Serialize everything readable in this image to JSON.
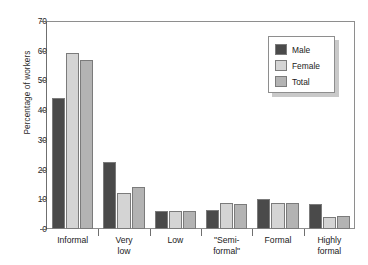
{
  "caption_sliver": "",
  "chart_data": {
    "type": "bar",
    "title": "",
    "xlabel": "",
    "ylabel": "Percentage of workers",
    "ylim": [
      0,
      70
    ],
    "ytick_step": 10,
    "yticks": [
      0,
      10,
      20,
      30,
      40,
      50,
      60,
      70
    ],
    "grid": false,
    "legend_position": "top-right",
    "categories": [
      "Informal",
      "Very low",
      "Low",
      "\"Semi-formal\"",
      "Formal",
      "Highly formal"
    ],
    "category_lines": [
      [
        "Informal"
      ],
      [
        "Very",
        "low"
      ],
      [
        "Low"
      ],
      [
        "\"Semi-",
        "formal\""
      ],
      [
        "Formal"
      ],
      [
        "Highly",
        "formal"
      ]
    ],
    "series": [
      {
        "name": "Male",
        "color": "#4a4a4a",
        "values": [
          44.0,
          22.5,
          6.1,
          6.5,
          10.2,
          8.4
        ]
      },
      {
        "name": "Female",
        "color": "#d4d4d4",
        "values": [
          59.2,
          12.1,
          6.0,
          8.8,
          8.8,
          4.0
        ]
      },
      {
        "name": "Total",
        "color": "#b3b3b3",
        "values": [
          56.9,
          14.1,
          6.1,
          8.3,
          8.8,
          4.4
        ]
      }
    ]
  },
  "legend": {
    "entries": [
      {
        "label": "Male"
      },
      {
        "label": "Female"
      },
      {
        "label": "Total"
      }
    ]
  }
}
